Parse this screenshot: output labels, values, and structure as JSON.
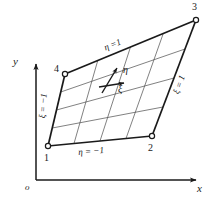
{
  "figure": {
    "type": "isoparametric-quadrilateral-element",
    "background_color": "#ffffff",
    "line_color": "#1a1a1a",
    "grid_color": "#4a4a4a"
  },
  "axes": {
    "x_label": "x",
    "y_label": "y",
    "origin_label": "o",
    "x_axis": {
      "x1": 36,
      "y1": 180,
      "x2": 198,
      "y2": 180
    },
    "y_axis": {
      "x1": 36,
      "y1": 180,
      "x2": 36,
      "y2": 62
    }
  },
  "nodes": [
    {
      "id": "1",
      "label": "1",
      "x": 48,
      "y": 146,
      "label_x": 44,
      "label_y": 153
    },
    {
      "id": "2",
      "label": "2",
      "x": 152,
      "y": 136,
      "label_x": 148,
      "label_y": 143
    },
    {
      "id": "3",
      "label": "3",
      "x": 196,
      "y": 20,
      "label_x": 192,
      "label_y": 2
    },
    {
      "id": "4",
      "label": "4",
      "x": 65,
      "y": 74,
      "label_x": 54,
      "label_y": 66
    }
  ],
  "edge_labels": [
    {
      "name": "bottom",
      "text": "η = −1",
      "x": 80,
      "y": 150,
      "rotate": -5
    },
    {
      "name": "top",
      "text": "η =1",
      "x": 103,
      "y": 44,
      "rotate": -22
    },
    {
      "name": "left",
      "text": "ξ = −1",
      "x": 38,
      "y": 114,
      "rotate": -86
    },
    {
      "name": "right",
      "text": "ξ = 1",
      "x": 172,
      "y": 86,
      "rotate": -70
    }
  ],
  "direction_arrows": [
    {
      "name": "eta",
      "label": "η",
      "label_x": 124,
      "label_y": 72,
      "x1": 103,
      "y1": 92,
      "x2": 118,
      "y2": 67
    },
    {
      "name": "xi",
      "label": "ξ",
      "label_x": 119,
      "label_y": 89,
      "x1": 100,
      "y1": 86,
      "x2": 125,
      "y2": 82
    }
  ],
  "grid": {
    "divisions": 4,
    "internal_lines_xi": 3,
    "internal_lines_eta": 3
  }
}
